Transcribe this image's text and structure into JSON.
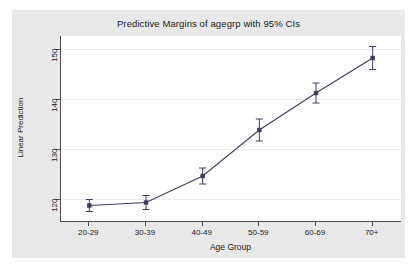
{
  "chart_data": {
    "type": "line",
    "title": "Predictive Margins of agegrp with 95% CIs",
    "xlabel": "Age Group",
    "ylabel": "Linear Prediction",
    "categories": [
      "20-29",
      "30-39",
      "40-49",
      "50-59",
      "60-69",
      "70+"
    ],
    "yticks": [
      120,
      130,
      140,
      150
    ],
    "ylim": [
      115.5,
      152.5
    ],
    "grid": true,
    "legend": "none",
    "error_bars": "95% CI",
    "series": [
      {
        "name": "Linear Prediction",
        "values": [
          118.6,
          119.2,
          124.5,
          133.7,
          141.1,
          148.1
        ],
        "ci_low": [
          117.4,
          117.8,
          122.9,
          131.5,
          139.1,
          145.8
        ],
        "ci_high": [
          119.8,
          120.6,
          126.1,
          135.9,
          143.1,
          150.4
        ],
        "marker": "square",
        "color": "#3d3d5c"
      }
    ]
  },
  "colors": {
    "graph_background": "#e8e8e8",
    "plot_background": "#ffffff",
    "axis": "#4d4d4d",
    "grid": "#ececec",
    "series": "#3d3d5c",
    "text": "#1a1a1a"
  }
}
